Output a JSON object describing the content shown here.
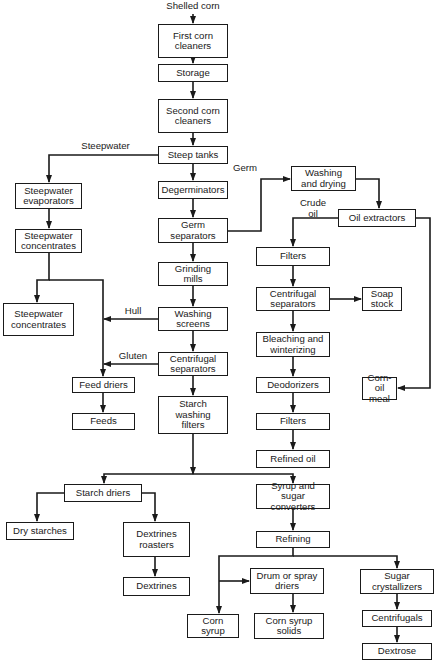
{
  "input": "Shelled corn",
  "nodes": {
    "first_cleaners": "First corn\ncleaners",
    "storage": "Storage",
    "second_cleaners": "Second corn\ncleaners",
    "steep_tanks": "Steep tanks",
    "sw_evaporators": "Steepwater\nevaporators",
    "sw_concentrates_1": "Steepwater\nconcentrates",
    "sw_concentrates_2": "Steepwater\nconcentrates",
    "degerminators": "Degerminators",
    "germ_separators": "Germ\nseparators",
    "grinding_mills": "Grinding\nmills",
    "washing_screens": "Washing\nscreens",
    "centrifugal_separators": "Centrifugal\nseparators",
    "starch_washing_filters": "Starch\nwashing\nfilters",
    "feed_driers": "Feed driers",
    "feeds": "Feeds",
    "washing_drying": "Washing\nand drying",
    "oil_extractors": "Oil extractors",
    "filters_1": "Filters",
    "oil_centrifugal": "Centrifugal\nseparators",
    "soap_stock": "Soap\nstock",
    "bleaching": "Bleaching and\nwinterizing",
    "deodorizers": "Deodorizers",
    "corn_oil_meal": "Corn-oil\nmeal",
    "filters_2": "Filters",
    "refined_oil": "Refined oil",
    "starch_driers": "Starch driers",
    "dry_starches": "Dry starches",
    "dextrines_roasters": "Dextrines\nroasters",
    "dextrines": "Dextrines",
    "syrup_converters": "Syrup and sugar\nconverters",
    "refining": "Refining",
    "corn_syrup": "Corn syrup",
    "drum_driers": "Drum or spray\ndriers",
    "corn_syrup_solids": "Corn syrup\nsolids",
    "sugar_crystallizers": "Sugar\ncrystallizers",
    "centrifugals": "Centrifugals",
    "dextrose": "Dextrose"
  },
  "edge_labels": {
    "steepwater": "Steepwater",
    "germ": "Germ",
    "crude_oil": "Crude\noil",
    "hull": "Hull",
    "gluten": "Gluten"
  }
}
